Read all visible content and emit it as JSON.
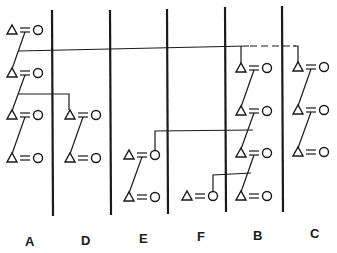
{
  "diagram": {
    "type": "kinship-lineage-chart",
    "line_color": "#1a1a1a",
    "columns": [
      {
        "id": "A",
        "label": "A",
        "x": 52
      },
      {
        "id": "D",
        "label": "D",
        "x": 110
      },
      {
        "id": "E",
        "label": "E",
        "x": 167
      },
      {
        "id": "F",
        "label": "F",
        "x": 225
      },
      {
        "id": "B",
        "label": "B",
        "x": 282
      },
      {
        "id": "C",
        "label": "C",
        "x": 339
      }
    ],
    "symbols": {
      "male": "triangle",
      "female": "circle",
      "marriage": "double-line"
    },
    "labels": {
      "A": "A",
      "D": "D",
      "E": "E",
      "F": "F",
      "B": "B",
      "C": "C"
    }
  }
}
